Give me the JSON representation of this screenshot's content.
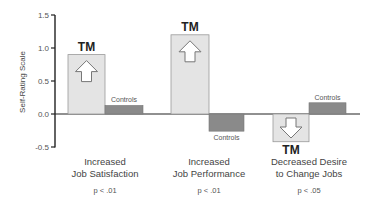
{
  "chart_data": {
    "type": "bar",
    "title": "",
    "xlabel": "",
    "ylabel": "Self-Rating Scale",
    "ylim": [
      -0.5,
      1.5
    ],
    "yticks": [
      "1.5",
      "1.0",
      "0.5",
      "0.0",
      "-0.5"
    ],
    "grid": false,
    "categories": [
      {
        "line1": "Increased",
        "line2": "Job Satisfaction",
        "p": "p < .01"
      },
      {
        "line1": "Increased",
        "line2": "Job Performance",
        "p": "p < .01"
      },
      {
        "line1": "Decreased Desire",
        "line2": "to Change Jobs",
        "p": "p < .05"
      }
    ],
    "series": [
      {
        "name": "TM",
        "values": [
          0.9,
          1.2,
          -0.42
        ],
        "color": "#e4e4e4",
        "arrows": [
          "up",
          "up",
          "down"
        ]
      },
      {
        "name": "Controls",
        "values": [
          0.13,
          -0.26,
          0.17
        ],
        "color": "#8a8a8a"
      }
    ]
  },
  "labels": {
    "tm": "TM",
    "controls": "Controls"
  }
}
